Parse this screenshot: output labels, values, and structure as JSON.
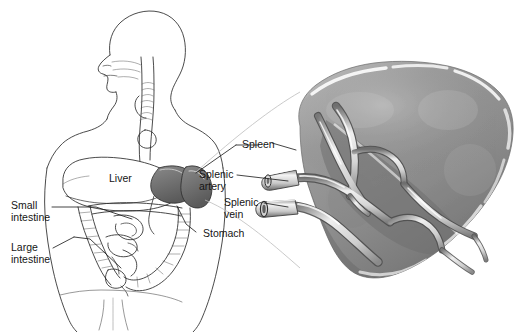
{
  "figure": {
    "type": "medical-line-and-tone-illustration",
    "background_color": "#ffffff",
    "ink_color": "#151515",
    "organ_tone_color": "#8f8f8f",
    "organ_shadow_color": "#5d5d5d",
    "organ_highlight_color": "#f2f2f2",
    "dark_organ_fill": "#6e6e6e"
  },
  "labels": {
    "small_intestine": {
      "line1": "Small",
      "line2": "intestine"
    },
    "large_intestine": {
      "line1": "Large",
      "line2": "intestine"
    },
    "liver": "Liver",
    "stomach": "Stomach",
    "spleen": "Spleen",
    "splenic_artery": {
      "line1": "Splenic",
      "line2": "artery"
    },
    "splenic_vein": {
      "line1": "Splenic",
      "line2": "vein"
    }
  },
  "panels": {
    "left_panel_name": "body-torso-overview",
    "right_panel_name": "spleen-magnified-detail"
  }
}
